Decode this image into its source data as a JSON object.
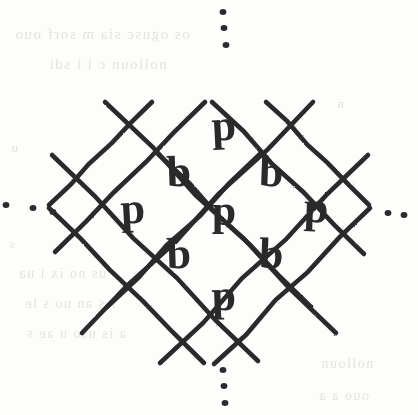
{
  "figure": {
    "name": "diagonal-lattice-with-letters",
    "ink_color": "#2b2b2b",
    "paper_color": "#fdfdfb",
    "ghost_text_color": "#cfcdc6",
    "line_width": 4.6,
    "cell_pitch": 54,
    "center": {
      "x": 224,
      "y": 211
    }
  },
  "lattice": {
    "lines_up": [
      {
        "x1": 55,
        "y1": 252,
        "x2": 205,
        "y2": 102
      },
      {
        "x1": 82,
        "y1": 333,
        "x2": 313,
        "y2": 102
      },
      {
        "x1": 160,
        "y1": 363,
        "x2": 368,
        "y2": 155
      },
      {
        "x1": 214,
        "y1": 364,
        "x2": 370,
        "y2": 208
      },
      {
        "x1": 107,
        "y1": 307,
        "x2": 260,
        "y2": 154
      },
      {
        "x1": 49,
        "y1": 205,
        "x2": 152,
        "y2": 102
      }
    ],
    "lines_down": [
      {
        "x1": 212,
        "y1": 102,
        "x2": 364,
        "y2": 254
      },
      {
        "x1": 105,
        "y1": 102,
        "x2": 336,
        "y2": 333
      },
      {
        "x1": 52,
        "y1": 155,
        "x2": 258,
        "y2": 361
      },
      {
        "x1": 49,
        "y1": 208,
        "x2": 204,
        "y2": 363
      },
      {
        "x1": 158,
        "y1": 154,
        "x2": 311,
        "y2": 307
      },
      {
        "x1": 266,
        "y1": 102,
        "x2": 369,
        "y2": 205
      }
    ]
  },
  "letters": [
    {
      "id": "cell-top",
      "char": "p",
      "x": 224,
      "y": 130,
      "rotate": -3,
      "size": 44
    },
    {
      "id": "cell-upper-left",
      "char": "b",
      "x": 179,
      "y": 176,
      "rotate": -2,
      "size": 44
    },
    {
      "id": "cell-upper-right",
      "char": "b",
      "x": 271,
      "y": 176,
      "rotate": 2,
      "size": 44
    },
    {
      "id": "cell-left",
      "char": "p",
      "x": 133,
      "y": 213,
      "rotate": -3,
      "size": 44
    },
    {
      "id": "cell-center",
      "char": "p",
      "x": 224,
      "y": 215,
      "rotate": 0,
      "size": 44
    },
    {
      "id": "cell-right",
      "char": "p",
      "x": 316,
      "y": 212,
      "rotate": 2,
      "size": 44
    },
    {
      "id": "cell-lower-left",
      "char": "b",
      "x": 179,
      "y": 258,
      "rotate": -2,
      "size": 44
    },
    {
      "id": "cell-lower-right",
      "char": "b",
      "x": 271,
      "y": 258,
      "rotate": 2,
      "size": 44
    },
    {
      "id": "cell-bottom",
      "char": "p",
      "x": 224,
      "y": 300,
      "rotate": -2,
      "size": 44
    }
  ],
  "ellipses": [
    {
      "id": "ellipsis-top",
      "orientation": "vertical",
      "dots": [
        {
          "x": 223,
          "y": 12
        },
        {
          "x": 224,
          "y": 28
        },
        {
          "x": 226,
          "y": 45
        }
      ]
    },
    {
      "id": "ellipsis-bottom",
      "orientation": "vertical",
      "dots": [
        {
          "x": 223,
          "y": 370
        },
        {
          "x": 224,
          "y": 386
        },
        {
          "x": 225,
          "y": 403
        }
      ]
    },
    {
      "id": "ellipsis-left",
      "orientation": "horizontal",
      "dots": [
        {
          "x": 6,
          "y": 205
        },
        {
          "x": 33,
          "y": 208
        },
        {
          "x": 53,
          "y": 212
        }
      ]
    },
    {
      "id": "ellipsis-right",
      "orientation": "horizontal",
      "dots": [
        {
          "x": 388,
          "y": 213
        },
        {
          "x": 404,
          "y": 215
        }
      ]
    }
  ],
  "ghost_text": {
    "note": "faint illegible show-through text from the reverse side of the page",
    "lines": [
      {
        "text": "os ogusc  sia  m   sorf   ouo",
        "x": 14,
        "y": 26,
        "size": 15
      },
      {
        "text": "nolloun  c   i  i  sdi",
        "x": 48,
        "y": 56,
        "size": 15
      },
      {
        "text": "n",
        "x": 336,
        "y": 96,
        "size": 13
      },
      {
        "text": "u",
        "x": 10,
        "y": 140,
        "size": 13
      },
      {
        "text": "i",
        "x": 350,
        "y": 178,
        "size": 13
      },
      {
        "text": "s",
        "x": 8,
        "y": 236,
        "size": 13
      },
      {
        "text": "us no   ix  i ua",
        "x": 18,
        "y": 266,
        "size": 14
      },
      {
        "text": "r  s  an  uo  s  le",
        "x": 24,
        "y": 296,
        "size": 14
      },
      {
        "text": "a  is  uso   u  ae   s",
        "x": 26,
        "y": 326,
        "size": 14
      },
      {
        "text": "nolloun",
        "x": 320,
        "y": 356,
        "size": 14
      },
      {
        "text": "ouo    a a",
        "x": 318,
        "y": 388,
        "size": 14
      }
    ]
  }
}
